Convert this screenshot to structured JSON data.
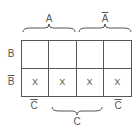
{
  "diagram": {
    "type": "karnaugh-map",
    "top_labels": [
      {
        "text": "A",
        "overline": false
      },
      {
        "text": "A",
        "overline": true
      }
    ],
    "row_labels": [
      {
        "text": "B",
        "overline": false
      },
      {
        "text": "B",
        "overline": true
      }
    ],
    "bottom_labels": [
      {
        "text": "C",
        "overline": true
      },
      {
        "text": "C",
        "overline": false
      },
      {
        "text": "C",
        "overline": true
      }
    ],
    "cells": [
      [
        "",
        "",
        "",
        ""
      ],
      [
        "X",
        "X",
        "X",
        "X"
      ]
    ]
  }
}
